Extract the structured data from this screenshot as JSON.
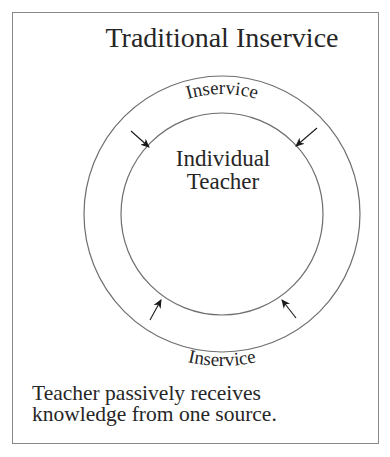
{
  "title": "Traditional Inservice",
  "center_label": {
    "line1": "Individual",
    "line2": "Teacher"
  },
  "ring_labels": {
    "top": "Inservice",
    "bottom": "Inservice"
  },
  "caption": {
    "line1": "Teacher passively receives",
    "line2": "knowledge from one source."
  },
  "diagram": {
    "center": [
      222,
      214
    ],
    "outer_radius": 138,
    "inner_radius": 101,
    "arrows": [
      {
        "name": "top-left",
        "from": [
          131,
          131
        ],
        "to": [
          149,
          147
        ]
      },
      {
        "name": "top-right",
        "from": [
          317,
          128
        ],
        "to": [
          296,
          146
        ]
      },
      {
        "name": "bottom-left",
        "from": [
          150,
          320
        ],
        "to": [
          161,
          300
        ]
      },
      {
        "name": "bottom-right",
        "from": [
          296,
          318
        ],
        "to": [
          282,
          300
        ]
      }
    ]
  },
  "colors": {
    "frame": "#8a8a8a",
    "circle": "#6e6e6e",
    "text": "#262626",
    "arrow": "#1a1a1a"
  }
}
